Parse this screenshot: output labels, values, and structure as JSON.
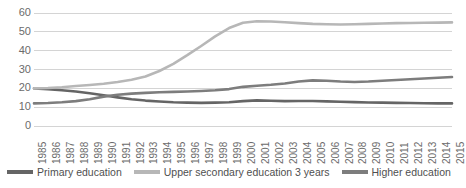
{
  "chart_data": {
    "type": "line",
    "title": "",
    "xlabel": "",
    "ylabel": "",
    "ylim": [
      0,
      60
    ],
    "ytick_step": 10,
    "grid": true,
    "legend_position": "bottom",
    "yticks": [
      "0",
      "10",
      "20",
      "30",
      "40",
      "50",
      "60"
    ],
    "categories": [
      "1985",
      "1986",
      "1987",
      "1988",
      "1989",
      "1990",
      "1991",
      "1992",
      "1993",
      "1994",
      "1995",
      "1996",
      "1997",
      "1998",
      "1999",
      "2000",
      "2001",
      "2002",
      "2003",
      "2004",
      "2005",
      "2006",
      "2007",
      "2008",
      "2009",
      "2010",
      "2011",
      "2012",
      "2013",
      "2014",
      "2015"
    ],
    "series": [
      {
        "name": "Primary education",
        "color": "#656565",
        "values": [
          20.0,
          19.6,
          19.0,
          18.3,
          17.4,
          16.3,
          15.2,
          14.2,
          13.5,
          13.0,
          12.6,
          12.4,
          12.3,
          12.4,
          12.6,
          13.2,
          13.6,
          13.4,
          13.2,
          13.3,
          13.3,
          13.1,
          12.9,
          12.7,
          12.5,
          12.4,
          12.3,
          12.2,
          12.1,
          12.0,
          12.0
        ]
      },
      {
        "name": "Upper secondary education 3 years",
        "color": "#b7b7b7",
        "values": [
          20.0,
          20.2,
          20.6,
          21.2,
          21.8,
          22.4,
          23.4,
          24.6,
          26.3,
          29.2,
          33.0,
          37.6,
          42.5,
          47.6,
          52.0,
          54.8,
          55.6,
          55.5,
          55.1,
          54.6,
          54.2,
          54.0,
          53.9,
          54.0,
          54.2,
          54.4,
          54.6,
          54.7,
          54.8,
          54.9,
          55.0
        ]
      },
      {
        "name": "Higher education",
        "color": "#7d7d7d",
        "values": [
          12.0,
          12.2,
          12.6,
          13.2,
          14.2,
          15.6,
          16.6,
          17.2,
          17.6,
          17.9,
          18.1,
          18.3,
          18.6,
          19.0,
          19.6,
          20.8,
          21.4,
          21.9,
          22.6,
          23.6,
          24.2,
          24.0,
          23.6,
          23.4,
          23.6,
          24.0,
          24.4,
          24.8,
          25.2,
          25.6,
          26.0
        ]
      }
    ]
  }
}
